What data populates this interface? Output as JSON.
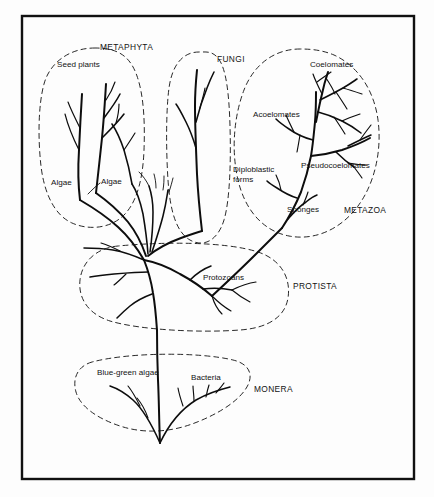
{
  "figure": {
    "type": "phylogenetic-tree-diagram",
    "title": "",
    "background_color": "#fdfdfd",
    "line_color": "#0d0d0d",
    "outline_color": "#1c1c1c",
    "frame": {
      "x": 21,
      "y": 15,
      "width": 394,
      "height": 465
    }
  },
  "kingdoms": [
    {
      "id": "metaphyta",
      "label": "METAPHYTA",
      "x": 100,
      "y": 50
    },
    {
      "id": "fungi",
      "label": "FUNGI",
      "x": 217,
      "y": 62
    },
    {
      "id": "metazoa",
      "label": "METAZOA",
      "x": 344,
      "y": 213
    },
    {
      "id": "protista",
      "label": "PROTISTA",
      "x": 293,
      "y": 289
    },
    {
      "id": "monera",
      "label": "MONERA",
      "x": 254,
      "y": 392
    }
  ],
  "groups": [
    {
      "id": "seed-plants",
      "label": "Seed plants",
      "x": 57,
      "y": 67
    },
    {
      "id": "algae-left",
      "label": "Algae",
      "x": 51,
      "y": 185
    },
    {
      "id": "algae-right",
      "label": "Algae",
      "x": 101,
      "y": 184
    },
    {
      "id": "coelomates",
      "label": "Coelomates",
      "x": 310,
      "y": 67
    },
    {
      "id": "acoelomates",
      "label": "Acoelomates",
      "x": 253,
      "y": 117
    },
    {
      "id": "pseudocoelomates",
      "label": "Pseudocoelomates",
      "x": 301,
      "y": 168
    },
    {
      "id": "diploblastic-forms",
      "label": "Diploblastic",
      "x": 233,
      "y": 172
    },
    {
      "id": "diploblastic-forms-2",
      "label": "forms",
      "x": 233,
      "y": 182
    },
    {
      "id": "sponges",
      "label": "Sponges",
      "x": 287,
      "y": 212
    },
    {
      "id": "protozoans",
      "label": "Protozoans",
      "x": 203,
      "y": 280
    },
    {
      "id": "blue-green-algae",
      "label": "Blue-green algae",
      "x": 97,
      "y": 375
    },
    {
      "id": "bacteria",
      "label": "Bacteria",
      "x": 191,
      "y": 380
    }
  ]
}
